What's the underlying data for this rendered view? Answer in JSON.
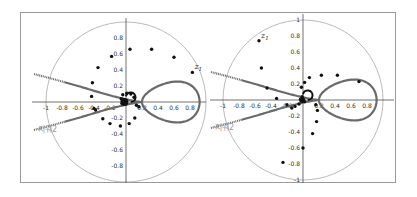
{
  "chart_data": [
    {
      "type": "scatter",
      "title": "",
      "xlabel": "",
      "ylabel": "",
      "xlim": [
        -1,
        1
      ],
      "ylim": [
        -1,
        1
      ],
      "grid": false,
      "unit_circle": true,
      "x_ticks": [
        "-1",
        "-0.8",
        "-0.6",
        "-0.4",
        "-0.2",
        "0.2",
        "0.4",
        "0.6",
        "0.8"
      ],
      "y_ticks": [
        "0.8",
        "0.6",
        "0.4",
        "0.2",
        "-0.2",
        "-0.4",
        "-0.6",
        "-0.8"
      ],
      "annotations": [
        {
          "text": "z",
          "sub": "1",
          "x": 0.83,
          "y": 0.37
        }
      ],
      "region_label": "지워2",
      "points": [
        {
          "x": 0.05,
          "y": 0.66
        },
        {
          "x": 0.32,
          "y": 0.66
        },
        {
          "x": 0.6,
          "y": 0.56
        },
        {
          "x": 0.83,
          "y": 0.37
        },
        {
          "x": -0.18,
          "y": 0.57
        },
        {
          "x": -0.35,
          "y": 0.43
        },
        {
          "x": -0.42,
          "y": 0.24
        },
        {
          "x": -0.43,
          "y": 0.07
        },
        {
          "x": -0.38,
          "y": -0.1
        },
        {
          "x": -0.4,
          "y": -0.08
        },
        {
          "x": -0.29,
          "y": -0.21
        },
        {
          "x": -0.2,
          "y": -0.27
        },
        {
          "x": -0.07,
          "y": -0.3
        },
        {
          "x": 0.04,
          "y": -0.27
        },
        {
          "x": 0.11,
          "y": -0.2
        },
        {
          "x": 0.13,
          "y": -0.04
        },
        {
          "x": 0.16,
          "y": -0.06
        },
        {
          "x": 0.1,
          "y": 0.06
        },
        {
          "x": 0.06,
          "y": 0.1
        },
        {
          "x": 0.01,
          "y": 0.11
        },
        {
          "x": -0.04,
          "y": 0.09
        },
        {
          "x": -0.06,
          "y": 0.04
        },
        {
          "x": -0.05,
          "y": -0.02
        },
        {
          "x": 0.0,
          "y": 0.0
        }
      ]
    },
    {
      "type": "scatter",
      "title": "",
      "xlabel": "",
      "ylabel": "",
      "xlim": [
        -1,
        1
      ],
      "ylim": [
        -1,
        1
      ],
      "grid": false,
      "unit_circle": true,
      "x_ticks": [
        "-1",
        "-0.8",
        "-0.6",
        "-0.4",
        "-0.2",
        "0.2",
        "0.4",
        "0.6",
        "0.8"
      ],
      "y_ticks": [
        "1",
        "0.8",
        "0.6",
        "0.4",
        "0.2",
        "-0.2",
        "-0.4",
        "-0.6",
        "-0.8",
        "-1"
      ],
      "annotations": [
        {
          "text": "z",
          "sub": "1",
          "x": -0.55,
          "y": 0.74
        }
      ],
      "region_label": "지워2",
      "points": [
        {
          "x": -0.55,
          "y": 0.74
        },
        {
          "x": -0.52,
          "y": 0.4
        },
        {
          "x": -0.45,
          "y": 0.15
        },
        {
          "x": -0.33,
          "y": 0.02
        },
        {
          "x": 0.08,
          "y": 0.28
        },
        {
          "x": 0.23,
          "y": 0.31
        },
        {
          "x": 0.43,
          "y": 0.31
        },
        {
          "x": 0.7,
          "y": 0.23
        },
        {
          "x": 0.02,
          "y": 0.22
        },
        {
          "x": -0.02,
          "y": 0.16
        },
        {
          "x": -0.05,
          "y": -0.05
        },
        {
          "x": -0.2,
          "y": -0.06
        },
        {
          "x": -0.14,
          "y": -0.1
        },
        {
          "x": -0.1,
          "y": -0.08
        },
        {
          "x": 0.16,
          "y": -0.06
        },
        {
          "x": 0.18,
          "y": -0.13
        },
        {
          "x": 0.17,
          "y": -0.27
        },
        {
          "x": 0.12,
          "y": -0.42
        },
        {
          "x": 0.0,
          "y": -0.6
        },
        {
          "x": -0.25,
          "y": -0.78
        },
        {
          "x": -0.03,
          "y": 0.01
        },
        {
          "x": 0.02,
          "y": -0.02
        },
        {
          "x": -0.01,
          "y": 0.04
        }
      ]
    }
  ]
}
